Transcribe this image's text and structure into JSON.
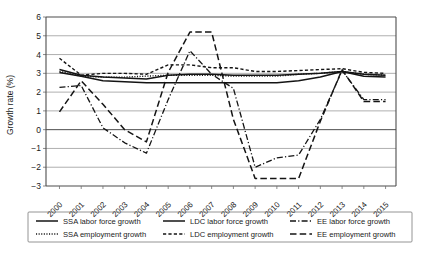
{
  "chart_data": {
    "type": "line",
    "title": "",
    "xlabel": "",
    "ylabel": "Growth rate (%)",
    "ylim": [
      -3,
      6
    ],
    "yticks": [
      6,
      5,
      4,
      3,
      2,
      1,
      0,
      -1,
      -2,
      -3
    ],
    "ytick_labels": [
      "6",
      "5",
      "4",
      "3",
      "2",
      "1",
      "0",
      "−1",
      "−2",
      "−3"
    ],
    "grid": "horizontal",
    "legend_position": "below",
    "categories": [
      "2000",
      "2001",
      "2002",
      "2003",
      "2004",
      "2005",
      "2006",
      "2007",
      "2008",
      "2009",
      "2010",
      "2011",
      "2012",
      "2013",
      "2014",
      "2015"
    ],
    "x": [
      2000,
      2001,
      2002,
      2003,
      2004,
      2005,
      2006,
      2007,
      2008,
      2009,
      2010,
      2011,
      2012,
      2013,
      2014,
      2015
    ],
    "series": [
      {
        "name": "SSA labor force growth",
        "style": "solid",
        "values": [
          3.2,
          2.9,
          2.8,
          2.75,
          2.7,
          2.9,
          2.95,
          2.95,
          2.9,
          2.9,
          2.9,
          2.95,
          3.0,
          3.1,
          2.95,
          2.9
        ]
      },
      {
        "name": "SSA employment growth",
        "style": "dotted",
        "values": [
          3.1,
          2.85,
          2.8,
          2.8,
          2.85,
          2.9,
          2.9,
          2.9,
          2.85,
          2.85,
          2.85,
          2.95,
          3.0,
          3.1,
          2.95,
          2.9
        ]
      },
      {
        "name": "LDC labor force growth",
        "style": "solid",
        "values": [
          3.05,
          2.85,
          2.6,
          2.55,
          2.5,
          2.5,
          2.5,
          2.5,
          2.5,
          2.5,
          2.5,
          2.6,
          2.8,
          3.1,
          2.85,
          2.8
        ]
      },
      {
        "name": "LDC employment growth",
        "style": "dashed-short",
        "values": [
          3.8,
          2.9,
          3.0,
          3.0,
          2.95,
          3.45,
          3.45,
          3.3,
          3.3,
          3.1,
          3.1,
          3.15,
          3.2,
          3.25,
          3.05,
          3.0
        ]
      },
      {
        "name": "EE labor force growth",
        "style": "dash-dot",
        "values": [
          2.25,
          2.35,
          0.1,
          -0.7,
          -1.25,
          1.6,
          4.2,
          2.95,
          2.2,
          -2.0,
          -1.5,
          -1.35,
          0.55,
          3.15,
          1.6,
          1.6
        ]
      },
      {
        "name": "EE employment growth",
        "style": "dashed-long",
        "values": [
          0.95,
          2.6,
          1.35,
          0.0,
          -0.65,
          3.05,
          5.2,
          5.2,
          0.55,
          -2.6,
          -2.6,
          -2.6,
          0.45,
          3.2,
          1.5,
          1.5
        ]
      }
    ],
    "legend_entries": [
      {
        "label": "SSA labor force growth",
        "style": "solid"
      },
      {
        "label": "LDC labor force growth",
        "style": "solid"
      },
      {
        "label": "EE labor force growth",
        "style": "dash-dot"
      },
      {
        "label": "SSA employment growth",
        "style": "dotted"
      },
      {
        "label": "LDC employment growth",
        "style": "dashed-short"
      },
      {
        "label": "EE employment growth",
        "style": "dashed-long"
      }
    ],
    "colors": {
      "series": "#141414",
      "grid": "#8c8c8c",
      "axis": "#4d4d4d",
      "background": "#ffffff"
    }
  }
}
